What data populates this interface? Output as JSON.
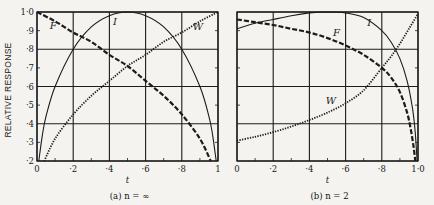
{
  "figure": {
    "ylabel": "RELATIVE RESPONSE",
    "xlabel": "t",
    "panels": [
      {
        "caption": "(a)  n = ∞",
        "x_ticks": [
          "0",
          "·2",
          "·4",
          "·6",
          "·8",
          "1"
        ]
      },
      {
        "caption": "(b)  n = 2",
        "x_ticks": [
          "0",
          "·2",
          "·4",
          "·6",
          "·8",
          "1·0"
        ]
      }
    ],
    "y_ticks": [
      "·2",
      "·3",
      "·4",
      "·5",
      "·6",
      "·7",
      "·8",
      "·9",
      "1·0"
    ]
  },
  "chart_data": [
    {
      "type": "line",
      "title": "(a) n = ∞",
      "xlabel": "t",
      "ylabel": "RELATIVE RESPONSE",
      "xlim": [
        0,
        1
      ],
      "ylim": [
        0.2,
        1.0
      ],
      "grid": true,
      "x_ticks": [
        0,
        0.2,
        0.4,
        0.6,
        0.8,
        1.0
      ],
      "y_ticks": [
        0.2,
        0.3,
        0.4,
        0.5,
        0.6,
        0.7,
        0.8,
        0.9,
        1.0
      ],
      "series": [
        {
          "name": "I",
          "style": "solid",
          "x": [
            0.01,
            0.03,
            0.05,
            0.1,
            0.2,
            0.3,
            0.4,
            0.5,
            0.6,
            0.7,
            0.8,
            0.9,
            0.95,
            0.97,
            0.99
          ],
          "y": [
            0.2,
            0.34,
            0.44,
            0.6,
            0.8,
            0.92,
            0.98,
            1.0,
            0.98,
            0.92,
            0.8,
            0.6,
            0.44,
            0.34,
            0.2
          ]
        },
        {
          "name": "F",
          "style": "dashed",
          "x": [
            0,
            0.1,
            0.2,
            0.3,
            0.4,
            0.5,
            0.6,
            0.7,
            0.8,
            0.9,
            0.96
          ],
          "y": [
            1.0,
            0.95,
            0.89,
            0.84,
            0.77,
            0.71,
            0.63,
            0.55,
            0.45,
            0.32,
            0.2
          ]
        },
        {
          "name": "W",
          "style": "dotted",
          "x": [
            0.04,
            0.1,
            0.2,
            0.3,
            0.4,
            0.5,
            0.6,
            0.7,
            0.8,
            0.9,
            1.0
          ],
          "y": [
            0.2,
            0.32,
            0.45,
            0.55,
            0.63,
            0.71,
            0.77,
            0.84,
            0.89,
            0.95,
            1.0
          ]
        }
      ],
      "annotations": [
        "I",
        "F",
        "W"
      ]
    },
    {
      "type": "line",
      "title": "(b) n = 2",
      "xlabel": "t",
      "ylabel": "RELATIVE RESPONSE",
      "xlim": [
        0,
        1
      ],
      "ylim": [
        0.2,
        1.0
      ],
      "grid": true,
      "x_ticks": [
        0,
        0.2,
        0.4,
        0.6,
        0.8,
        1.0
      ],
      "y_ticks": [
        0.2,
        0.3,
        0.4,
        0.5,
        0.6,
        0.7,
        0.8,
        0.9,
        1.0
      ],
      "series": [
        {
          "name": "I",
          "style": "solid",
          "x": [
            0,
            0.1,
            0.2,
            0.3,
            0.4,
            0.5,
            0.6,
            0.7,
            0.8,
            0.85,
            0.9,
            0.94,
            0.97,
            0.985,
            0.995
          ],
          "y": [
            0.91,
            0.94,
            0.96,
            0.98,
            0.995,
            1.0,
            0.995,
            0.97,
            0.9,
            0.84,
            0.75,
            0.63,
            0.48,
            0.35,
            0.2
          ]
        },
        {
          "name": "F",
          "style": "dashed",
          "x": [
            0,
            0.1,
            0.2,
            0.3,
            0.4,
            0.5,
            0.6,
            0.7,
            0.8,
            0.85,
            0.9,
            0.94,
            0.96,
            0.975,
            0.985
          ],
          "y": [
            0.96,
            0.945,
            0.93,
            0.91,
            0.89,
            0.86,
            0.82,
            0.77,
            0.7,
            0.65,
            0.57,
            0.46,
            0.37,
            0.28,
            0.2
          ]
        },
        {
          "name": "W",
          "style": "dotted",
          "x": [
            0,
            0.1,
            0.2,
            0.3,
            0.4,
            0.5,
            0.6,
            0.7,
            0.8,
            0.85,
            0.9,
            0.95,
            1.0
          ],
          "y": [
            0.31,
            0.33,
            0.355,
            0.385,
            0.42,
            0.46,
            0.51,
            0.58,
            0.7,
            0.76,
            0.83,
            0.91,
            0.99
          ]
        }
      ],
      "annotations": [
        "I",
        "F",
        "W"
      ]
    }
  ]
}
